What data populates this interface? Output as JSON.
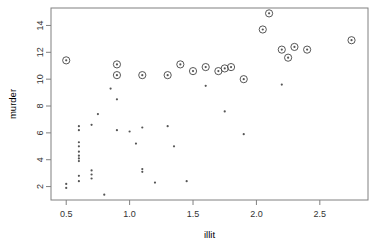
{
  "chart_data": {
    "type": "scatter",
    "title": "",
    "xlabel": "illit",
    "ylabel": "murder",
    "xlim": [
      0.38,
      2.88
    ],
    "ylim": [
      1.0,
      15.3
    ],
    "xticks": [
      0.5,
      1.0,
      1.5,
      2.0,
      2.5
    ],
    "xticklabels": [
      "0.5",
      "1.0",
      "1.5",
      "2.0",
      "2.5"
    ],
    "yticks": [
      2,
      4,
      6,
      8,
      10,
      12,
      14
    ],
    "yticklabels": [
      "2",
      "4",
      "6",
      "8",
      "10",
      "12",
      "14"
    ],
    "grid": false,
    "legend": null,
    "frame": true,
    "series": [
      {
        "name": "highlighted",
        "marker": "circled-dot",
        "color": "#444444",
        "points": [
          {
            "x": 0.5,
            "y": 11.4
          },
          {
            "x": 0.9,
            "y": 11.1
          },
          {
            "x": 0.9,
            "y": 10.3
          },
          {
            "x": 1.1,
            "y": 10.3
          },
          {
            "x": 1.3,
            "y": 10.3
          },
          {
            "x": 1.4,
            "y": 11.1
          },
          {
            "x": 1.5,
            "y": 10.6
          },
          {
            "x": 1.6,
            "y": 10.9
          },
          {
            "x": 1.7,
            "y": 10.6
          },
          {
            "x": 1.75,
            "y": 10.8
          },
          {
            "x": 1.8,
            "y": 10.9
          },
          {
            "x": 1.9,
            "y": 10.0
          },
          {
            "x": 2.05,
            "y": 13.7
          },
          {
            "x": 2.1,
            "y": 14.9
          },
          {
            "x": 2.2,
            "y": 12.2
          },
          {
            "x": 2.25,
            "y": 11.6
          },
          {
            "x": 2.3,
            "y": 12.4
          },
          {
            "x": 2.4,
            "y": 12.2
          },
          {
            "x": 2.75,
            "y": 12.9
          }
        ]
      },
      {
        "name": "plain",
        "marker": "dot",
        "color": "#555555",
        "points": [
          {
            "x": 0.5,
            "y": 2.2
          },
          {
            "x": 0.5,
            "y": 1.9
          },
          {
            "x": 0.6,
            "y": 5.3
          },
          {
            "x": 0.6,
            "y": 5.0
          },
          {
            "x": 0.6,
            "y": 4.6
          },
          {
            "x": 0.6,
            "y": 4.3
          },
          {
            "x": 0.6,
            "y": 4.1
          },
          {
            "x": 0.6,
            "y": 3.9
          },
          {
            "x": 0.6,
            "y": 6.5
          },
          {
            "x": 0.6,
            "y": 6.2
          },
          {
            "x": 0.6,
            "y": 2.8
          },
          {
            "x": 0.6,
            "y": 2.4
          },
          {
            "x": 0.7,
            "y": 6.6
          },
          {
            "x": 0.7,
            "y": 3.2
          },
          {
            "x": 0.7,
            "y": 2.9
          },
          {
            "x": 0.7,
            "y": 2.6
          },
          {
            "x": 0.75,
            "y": 7.4
          },
          {
            "x": 0.8,
            "y": 1.4
          },
          {
            "x": 0.85,
            "y": 9.3
          },
          {
            "x": 0.9,
            "y": 8.5
          },
          {
            "x": 0.9,
            "y": 6.2
          },
          {
            "x": 1.0,
            "y": 6.1
          },
          {
            "x": 1.05,
            "y": 5.2
          },
          {
            "x": 1.1,
            "y": 6.4
          },
          {
            "x": 1.1,
            "y": 3.3
          },
          {
            "x": 1.1,
            "y": 3.1
          },
          {
            "x": 1.2,
            "y": 2.3
          },
          {
            "x": 1.3,
            "y": 6.5
          },
          {
            "x": 1.35,
            "y": 5.0
          },
          {
            "x": 1.45,
            "y": 2.4
          },
          {
            "x": 1.6,
            "y": 9.5
          },
          {
            "x": 1.75,
            "y": 7.6
          },
          {
            "x": 1.9,
            "y": 5.9
          },
          {
            "x": 2.2,
            "y": 9.6
          }
        ]
      }
    ]
  }
}
